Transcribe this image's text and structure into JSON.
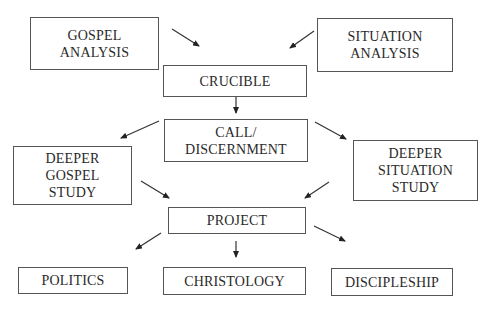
{
  "diagram": {
    "nodes": {
      "gospel_analysis": {
        "lines": [
          "GOSPEL",
          "ANALYSIS"
        ]
      },
      "situation_analysis": {
        "lines": [
          "SITUATION",
          "ANALYSIS"
        ]
      },
      "crucible": {
        "lines": [
          "CRUCIBLE"
        ]
      },
      "call_discernment": {
        "lines": [
          "CALL/",
          "DISCERNMENT"
        ]
      },
      "deeper_gospel_study": {
        "lines": [
          "DEEPER",
          "GOSPEL",
          "STUDY"
        ]
      },
      "deeper_situation_study": {
        "lines": [
          "DEEPER",
          "SITUATION",
          "STUDY"
        ]
      },
      "project": {
        "lines": [
          "PROJECT"
        ]
      },
      "politics": {
        "lines": [
          "POLITICS"
        ]
      },
      "christology": {
        "lines": [
          "CHRISTOLOGY"
        ]
      },
      "discipleship": {
        "lines": [
          "DISCIPLESHIP"
        ]
      }
    },
    "edges": [
      {
        "from": "gospel_analysis",
        "to": "crucible"
      },
      {
        "from": "situation_analysis",
        "to": "crucible"
      },
      {
        "from": "crucible",
        "to": "call_discernment"
      },
      {
        "from": "call_discernment",
        "to": "deeper_gospel_study"
      },
      {
        "from": "call_discernment",
        "to": "deeper_situation_study"
      },
      {
        "from": "deeper_gospel_study",
        "to": "project"
      },
      {
        "from": "deeper_situation_study",
        "to": "project"
      },
      {
        "from": "project",
        "to": "politics"
      },
      {
        "from": "project",
        "to": "christology"
      },
      {
        "from": "project",
        "to": "discipleship"
      }
    ],
    "colors": {
      "stroke": "#555555",
      "text": "#2a2a2a",
      "background": "#ffffff"
    }
  }
}
